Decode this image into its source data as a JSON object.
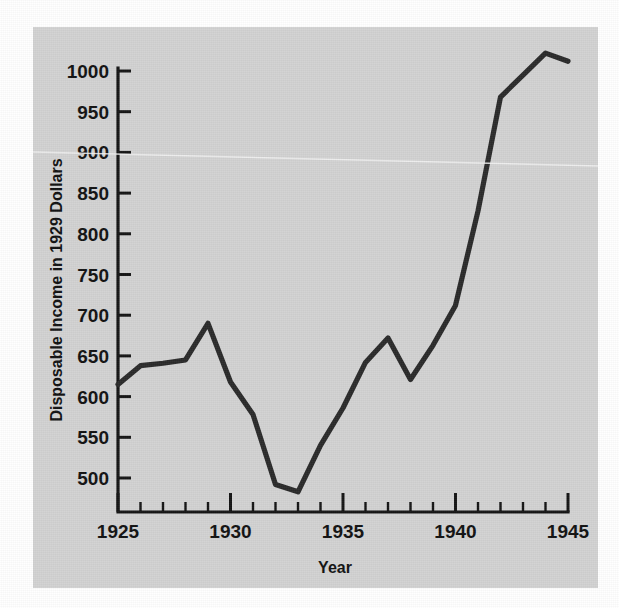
{
  "figure": {
    "background_color": "#ffffff",
    "panel_color": "#d2d2d2",
    "line_color": "#2a2a2a",
    "axis_color": "#141414"
  },
  "chart_data": {
    "type": "line",
    "title": "",
    "xlabel": "Year",
    "ylabel": "Disposable Income in 1929 Dollars",
    "xlim": [
      1925,
      1945
    ],
    "ylim": [
      470,
      1035
    ],
    "grid": false,
    "legend": false,
    "x_major_ticks": [
      1925,
      1930,
      1935,
      1940,
      1945
    ],
    "x_major_tick_labels": [
      "1925",
      "1930",
      "1935",
      "1940",
      "1945"
    ],
    "x_minor_tick_step": 1,
    "y_ticks": [
      500,
      550,
      600,
      650,
      700,
      750,
      800,
      850,
      900,
      950,
      1000
    ],
    "y_tick_labels": [
      "500",
      "550",
      "600",
      "650",
      "700",
      "750",
      "800",
      "850",
      "900",
      "950",
      "1000"
    ],
    "x": [
      1925,
      1926,
      1927,
      1928,
      1929,
      1930,
      1931,
      1932,
      1933,
      1934,
      1935,
      1936,
      1937,
      1938,
      1939,
      1940,
      1941,
      1942,
      1943,
      1944,
      1945
    ],
    "values": [
      615,
      638,
      641,
      645,
      690,
      618,
      578,
      492,
      483,
      540,
      586,
      642,
      672,
      621,
      663,
      712,
      828,
      968,
      995,
      1022,
      1012
    ],
    "series": [
      {
        "name": "Disposable Income",
        "values": [
          615,
          638,
          641,
          645,
          690,
          618,
          578,
          492,
          483,
          540,
          586,
          642,
          672,
          621,
          663,
          712,
          828,
          968,
          995,
          1022,
          1012
        ]
      }
    ]
  }
}
